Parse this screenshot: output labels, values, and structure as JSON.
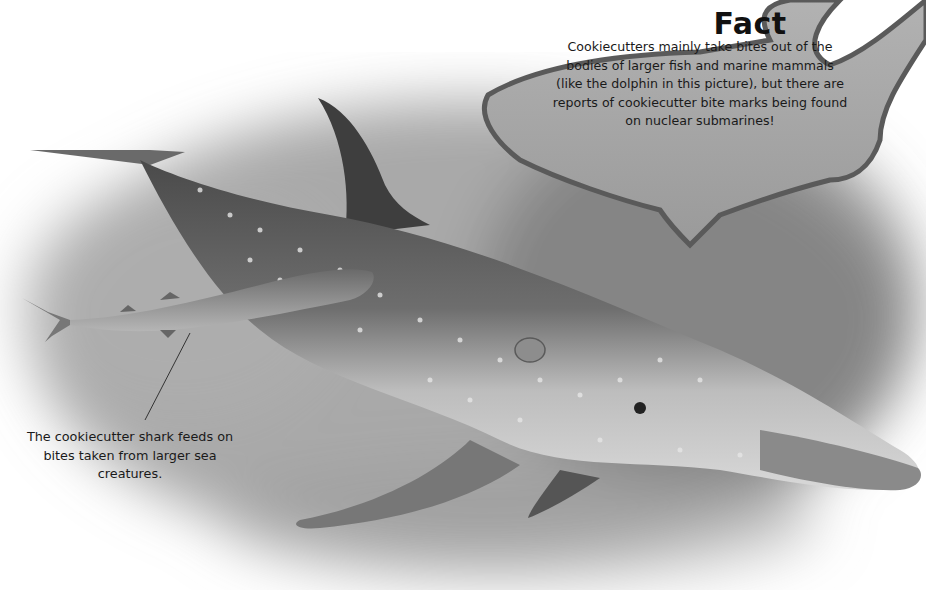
{
  "fact_box": {
    "title": "Fact",
    "text": "Cookiecutters mainly take bites out of the bodies of larger fish and marine mammals (like the dolphin in this picture), but there are reports of cookiecutter bite marks being found on nuclear submarines!"
  },
  "caption": {
    "text": "The cookiecutter shark feeds on bites taken from larger sea creatures."
  },
  "illustration": {
    "subjects": [
      "dolphin",
      "cookiecutter shark"
    ]
  },
  "colors": {
    "background": "#ffffff",
    "water_shade": "#8a8a8a",
    "fact_shape_fill": "#a8a8a8",
    "fact_shape_border": "#5a5a5a",
    "text": "#1a1a1a"
  }
}
